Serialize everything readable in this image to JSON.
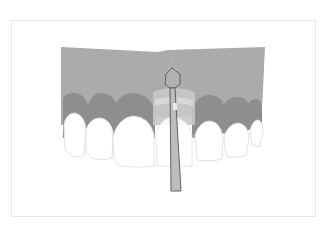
{
  "figure": {
    "colors": {
      "background": "#ffffff",
      "frame_border": "#e6e6e6",
      "bone": "#ababab",
      "gingiva": "#8e8e8e",
      "tooth_fill": "#ffffff",
      "tooth_outline": "#e2e2e2",
      "surgical_zone": "#c8c8c8",
      "instrument_fill": "#bdbdbd",
      "instrument_outline": "#555555"
    }
  }
}
